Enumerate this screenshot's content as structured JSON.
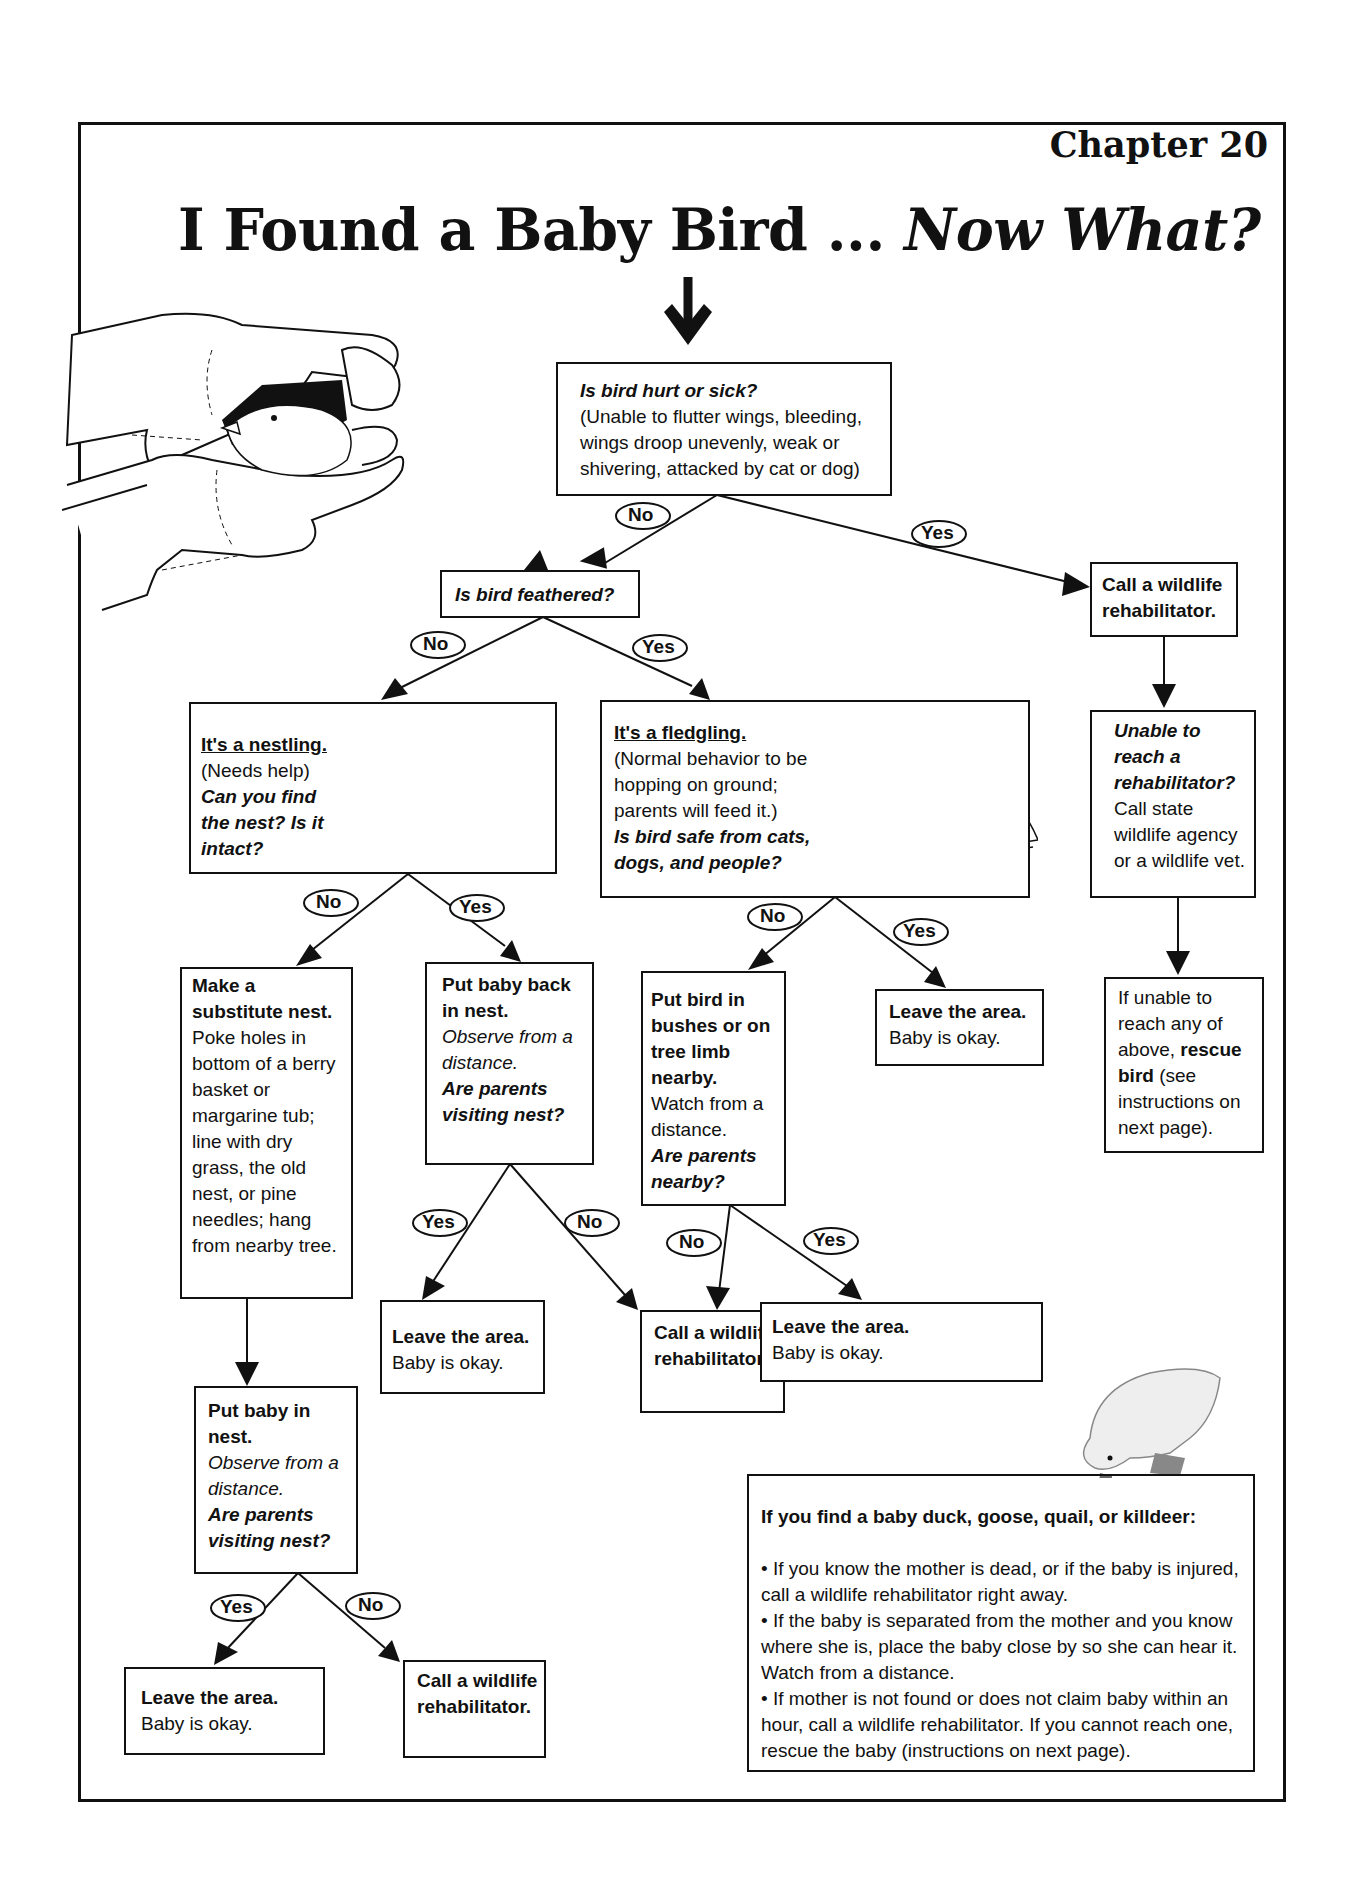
{
  "header": {
    "chapter": "Chapter 20",
    "title_main": "I Found a Baby Bird ... ",
    "title_italic": "Now What?"
  },
  "nodes": {
    "hurt": {
      "question": "Is bird hurt or sick?",
      "detail": "(Unable to flutter wings, bleeding, wings droop unevenly, weak or shivering, attacked by cat or dog)"
    },
    "feathered": {
      "question": "Is bird feathered?"
    },
    "call_rehab_top": {
      "text": "Call a wildlife rehabilitator."
    },
    "unable_reach": {
      "question": "Unable to reach a rehabilitator?",
      "detail": "Call state wildlife agency or a wildlife vet."
    },
    "if_unable_any": {
      "text_pre": "If unable to reach any of above, ",
      "text_bold": "rescue bird",
      "text_post": " (see instructions on next page)."
    },
    "nestling": {
      "heading": "It's a nestling.",
      "detail": "(Needs help)",
      "question": "Can you find the nest? Is it intact?"
    },
    "fledgling": {
      "heading": "It's a fledgling.",
      "detail": "(Normal behavior to be hopping on ground; parents will feed it.)",
      "question": "Is bird safe from cats, dogs, and people?"
    },
    "substitute_nest": {
      "heading": "Make a substitute nest.",
      "detail": "Poke holes in bottom of a berry basket or margarine tub; line with dry grass, the old nest, or pine needles; hang from nearby tree."
    },
    "put_back": {
      "heading": "Put baby back in nest.",
      "observe": "Observe from a distance.",
      "question": "Are parents visiting nest?"
    },
    "put_bushes": {
      "heading": "Put bird in bushes or on tree limb nearby.",
      "detail": "Watch from a distance.",
      "question": "Are parents nearby?"
    },
    "leave_fledgling_safe": {
      "heading": "Leave the area.",
      "detail": "Baby is okay."
    },
    "leave_put_back_yes": {
      "heading": "Leave the area.",
      "detail": "Baby is okay."
    },
    "call_rehab_mid": {
      "text": "Call a wildlife rehabilitator."
    },
    "leave_parents_nearby": {
      "heading": "Leave the area.",
      "detail": "Baby is okay."
    },
    "put_in_nest": {
      "heading": "Put baby in nest.",
      "observe": "Observe from a distance.",
      "question": "Are parents visiting nest?"
    },
    "leave_bottom": {
      "heading": "Leave the area.",
      "detail": "Baby is okay."
    },
    "call_rehab_bottom": {
      "text": "Call a wildlife rehabilitator."
    }
  },
  "edge_labels": {
    "yes": "Yes",
    "no": "No"
  },
  "duck_box": {
    "heading": "If you find a baby duck, goose, quail, or killdeer:",
    "bullets": [
      "• If you know the mother is dead, or if the baby is injured, call a wildlife rehabilitator right away.",
      "• If the baby is separated from the mother and you know where she is, place the baby close by so she can hear it. Watch from a distance.",
      "• If mother is not found or does not claim baby within an hour, call a wildlife rehabilitator. If you cannot reach one, rescue the baby (instructions on next page)."
    ]
  },
  "illustrations": {
    "gloved_hands": "gloved-hands-holding-bird",
    "nestling": "nestling-bird",
    "fledgling": "fledgling-bird-on-branch",
    "duckling": "duckling"
  }
}
